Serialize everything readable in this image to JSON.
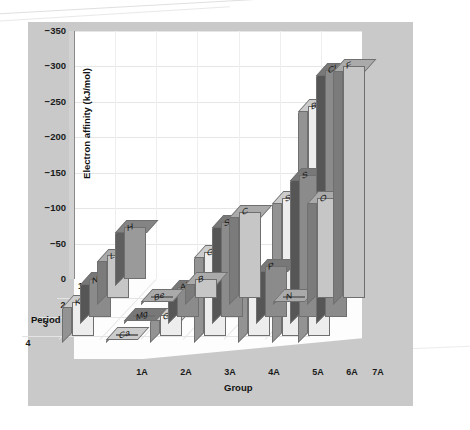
{
  "chart_data": {
    "type": "bar",
    "title": "",
    "xlabel": "Group",
    "ylabel": "Electron affinity (kJ/mol)",
    "zlabel": "Period",
    "ylim": [
      0,
      -350
    ],
    "yticks": [
      "0",
      "−50",
      "−100",
      "−150",
      "−200",
      "−250",
      "−300",
      "−350"
    ],
    "ytick_values": [
      0,
      -50,
      -100,
      -150,
      -200,
      -250,
      -300,
      -350
    ],
    "categories": [
      "1A",
      "2A",
      "3A",
      "4A",
      "5A",
      "6A",
      "7A"
    ],
    "periods": [
      "1",
      "2",
      "3",
      "4"
    ],
    "grid": true,
    "legend": "none",
    "series": [
      {
        "name": "1",
        "color": "#9a9a9a",
        "points": [
          {
            "group": "1A",
            "element": "H",
            "value": -73
          }
        ]
      },
      {
        "name": "2",
        "color": "#c6c6c6",
        "points": [
          {
            "group": "1A",
            "element": "Li",
            "value": -60
          },
          {
            "group": "2A",
            "element": "Be",
            "value": 0
          },
          {
            "group": "3A",
            "element": "B",
            "value": -27
          },
          {
            "group": "4A",
            "element": "C",
            "value": -122
          },
          {
            "group": "5A",
            "element": "N",
            "value": 0
          },
          {
            "group": "6A",
            "element": "O",
            "value": -141
          },
          {
            "group": "7A",
            "element": "F",
            "value": -328
          }
        ]
      },
      {
        "name": "3",
        "color": "#8b8b8b",
        "points": [
          {
            "group": "1A",
            "element": "Na",
            "value": -53
          },
          {
            "group": "2A",
            "element": "Mg",
            "value": 0
          },
          {
            "group": "3A",
            "element": "Al",
            "value": -43
          },
          {
            "group": "4A",
            "element": "Si",
            "value": -134
          },
          {
            "group": "5A",
            "element": "P",
            "value": -72
          },
          {
            "group": "6A",
            "element": "S",
            "value": -200
          },
          {
            "group": "7A",
            "element": "Cl",
            "value": -349
          }
        ]
      },
      {
        "name": "4",
        "color": "#ededed",
        "points": [
          {
            "group": "1A",
            "element": "K",
            "value": -48
          },
          {
            "group": "2A",
            "element": "Ca",
            "value": 0
          },
          {
            "group": "3A",
            "element": "Ga",
            "value": -29
          },
          {
            "group": "4A",
            "element": "Ge",
            "value": -119
          },
          {
            "group": "5A",
            "element": "As",
            "value": -78
          },
          {
            "group": "6A",
            "element": "Se",
            "value": -195
          },
          {
            "group": "7A",
            "element": "Br",
            "value": -325
          }
        ]
      }
    ]
  },
  "figure": {
    "background": "#c9c9c9",
    "plot_background": "#ffffff",
    "grid_color": "#e6e6e6"
  }
}
